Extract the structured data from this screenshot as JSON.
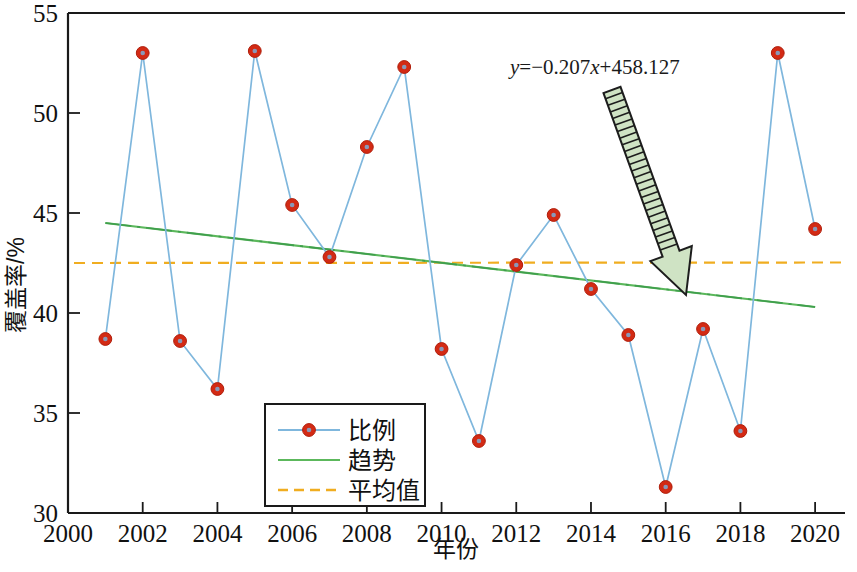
{
  "chart_data": {
    "type": "line",
    "title": "",
    "xlabel": "年份",
    "ylabel": "覆盖率/%",
    "xlim": [
      2000,
      2020.8
    ],
    "ylim": [
      30,
      55
    ],
    "xticks": [
      2000,
      2002,
      2004,
      2006,
      2008,
      2010,
      2012,
      2014,
      2016,
      2018,
      2020
    ],
    "xticklabels": [
      "2000",
      "2002",
      "2004",
      "2006",
      "2008",
      "2010",
      "2012",
      "2014",
      "2016",
      "2018",
      "2020"
    ],
    "yticks": [
      30,
      35,
      40,
      45,
      50,
      55
    ],
    "yticklabels": [
      "30",
      "35",
      "40",
      "45",
      "50",
      "55"
    ],
    "grid": false,
    "x": [
      2001,
      2002,
      2003,
      2004,
      2005,
      2006,
      2007,
      2008,
      2009,
      2010,
      2011,
      2012,
      2013,
      2014,
      2015,
      2016,
      2017,
      2018,
      2019,
      2020
    ],
    "series": [
      {
        "name": "比例",
        "type": "line-markers",
        "color": "#7fb7dd",
        "marker_color": "#d32a14",
        "values": [
          38.7,
          53.0,
          38.6,
          36.2,
          53.1,
          45.4,
          42.8,
          48.3,
          52.3,
          38.2,
          33.6,
          42.4,
          44.9,
          41.2,
          38.9,
          31.3,
          39.2,
          34.1,
          53.0,
          44.2
        ]
      },
      {
        "name": "趋势",
        "type": "trend",
        "color": "#5cb85c",
        "equation": "y=−0.207x+458.127",
        "slope": -0.207,
        "intercept": 458.127,
        "x_start": 2001,
        "x_end": 2020,
        "y_start": 44.5,
        "y_end": 40.3
      },
      {
        "name": "平均值",
        "type": "mean",
        "color": "#f0ad20",
        "value": 42.5
      }
    ],
    "annotations": [
      {
        "name": "trend-equation",
        "text": "y=−0.207x+458.127",
        "text_parts": {
          "lhs": "y",
          "rhs": "=−0.207",
          "xvar": "x",
          "tail": "+458.127"
        },
        "x": 510,
        "y": 74,
        "arrow": {
          "from_x": 612,
          "from_y": 90,
          "to_x": 686,
          "to_y": 295
        }
      }
    ],
    "legend": {
      "position": "bottom-center-left",
      "entries": [
        {
          "label": "比例",
          "style": "line-marker",
          "color": "#7fb7dd",
          "marker_color": "#d32a14"
        },
        {
          "label": "趋势",
          "style": "solid",
          "color": "#5cb85c"
        },
        {
          "label": "平均值",
          "style": "dashed",
          "color": "#f0ad20"
        }
      ]
    },
    "colors": {
      "series": "#7fb7dd",
      "marker": "#d32a14",
      "trend": "#5cb85c",
      "mean": "#f0ad20",
      "axis": "#1a1a1a",
      "background": "#ffffff"
    }
  }
}
